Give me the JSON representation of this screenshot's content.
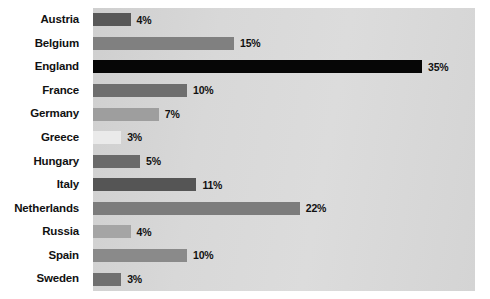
{
  "chart_data": {
    "type": "bar",
    "orientation": "horizontal",
    "title": "",
    "subtitle": "",
    "xlabel": "",
    "ylabel": "",
    "xlim": [
      0,
      40
    ],
    "grid": false,
    "legend": null,
    "value_suffix": "%",
    "categories": [
      "Austria",
      "Belgium",
      "England",
      "France",
      "Germany",
      "Greece",
      "Hungary",
      "Italy",
      "Netherlands",
      "Russia",
      "Spain",
      "Sweden"
    ],
    "values": [
      4,
      15,
      35,
      10,
      7,
      3,
      5,
      11,
      22,
      4,
      10,
      3
    ],
    "value_labels": [
      "4%",
      "15%",
      "35%",
      "10%",
      "7%",
      "3%",
      "5%",
      "11%",
      "22%",
      "4%",
      "10%",
      "3%"
    ],
    "bar_colors": [
      "#585858",
      "#808080",
      "#060606",
      "#6e6e6e",
      "#9e9e9e",
      "#eaeaea",
      "#6a6a6a",
      "#555555",
      "#7c7c7c",
      "#a5a5a5",
      "#8a8a8a",
      "#707070"
    ],
    "plot_background": "#d6d6d6",
    "page_background": "#ffffff",
    "label_color": "#111111"
  },
  "bars": [
    {
      "category": "Austria",
      "value": 4,
      "label": "4%",
      "color": "#585858"
    },
    {
      "category": "Belgium",
      "value": 15,
      "label": "15%",
      "color": "#808080"
    },
    {
      "category": "England",
      "value": 35,
      "label": "35%",
      "color": "#060606"
    },
    {
      "category": "France",
      "value": 10,
      "label": "10%",
      "color": "#6e6e6e"
    },
    {
      "category": "Germany",
      "value": 7,
      "label": "7%",
      "color": "#9e9e9e"
    },
    {
      "category": "Greece",
      "value": 3,
      "label": "3%",
      "color": "#eaeaea"
    },
    {
      "category": "Hungary",
      "value": 5,
      "label": "5%",
      "color": "#6a6a6a"
    },
    {
      "category": "Italy",
      "value": 11,
      "label": "11%",
      "color": "#555555"
    },
    {
      "category": "Netherlands",
      "value": 22,
      "label": "22%",
      "color": "#7c7c7c"
    },
    {
      "category": "Russia",
      "value": 4,
      "label": "4%",
      "color": "#a5a5a5"
    },
    {
      "category": "Spain",
      "value": 10,
      "label": "10%",
      "color": "#8a8a8a"
    },
    {
      "category": "Sweden",
      "value": 3,
      "label": "3%",
      "color": "#707070"
    }
  ],
  "scale": {
    "pixels_per_percent": 9.4,
    "plot_left_px": 93,
    "plot_top_px": 8,
    "plot_width_px": 382,
    "plot_height_px": 283
  }
}
